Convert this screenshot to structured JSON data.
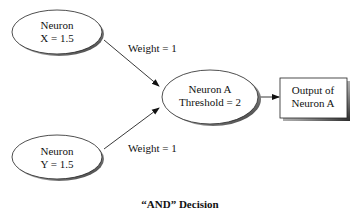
{
  "diagram": {
    "nodes": {
      "neuron_x": {
        "line1": "Neuron",
        "line2": "X = 1.5"
      },
      "neuron_y": {
        "line1": "Neuron",
        "line2": "Y = 1.5"
      },
      "neuron_a": {
        "line1": "Neuron A",
        "line2": "Threshold = 2"
      },
      "output": {
        "line1": "Output of",
        "line2": "Neuron A"
      }
    },
    "edges": {
      "x_to_a": {
        "label": "Weight = 1"
      },
      "y_to_a": {
        "label": "Weight = 1"
      },
      "a_to_output": {
        "label": ""
      }
    },
    "caption": "“AND” Decision"
  }
}
